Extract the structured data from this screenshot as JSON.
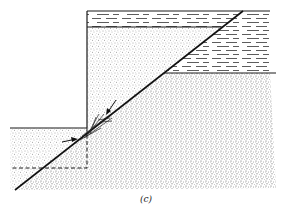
{
  "figure": {
    "caption": "(c)",
    "type": "geologic cross-section",
    "colors": {
      "ink": "#1a1a1a",
      "stipple": "#555555",
      "background": "#ffffff"
    },
    "elements": {
      "fault_line": {
        "from": [
          15,
          190
        ],
        "to": [
          243,
          11
        ]
      },
      "upper_block_frame": {
        "left": 87,
        "top": 11,
        "right": 270
      },
      "shale_layer_footwall": {
        "top": 11,
        "bottom": 27
      },
      "shale_layer_hangingwall": {
        "top": 27,
        "bottom": 73
      },
      "lower_step_top": 128,
      "dashed_projection": {
        "x": 87,
        "y_top": 128,
        "y_bottom": 168,
        "x_left": 12
      },
      "arrows": [
        {
          "name": "arrow-down-fault",
          "from": [
            116,
            100
          ],
          "to": [
            107,
            113
          ]
        },
        {
          "name": "arrow-right-step",
          "from": [
            62,
            141
          ],
          "to": [
            77,
            139
          ]
        }
      ]
    }
  }
}
